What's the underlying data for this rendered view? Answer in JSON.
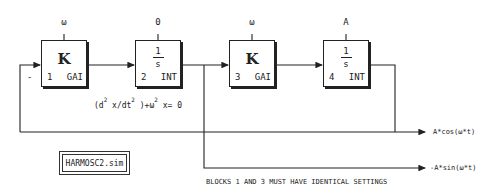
{
  "diagram": {
    "blocks": [
      {
        "id": 1,
        "symbol": "K",
        "type": "GAI",
        "param": "ω"
      },
      {
        "id": 2,
        "symbol_num": "1",
        "symbol_den": "s",
        "type": "INT",
        "param": "0"
      },
      {
        "id": 3,
        "symbol": "K",
        "type": "GAI",
        "param": "ω"
      },
      {
        "id": 4,
        "symbol_num": "1",
        "symbol_den": "s",
        "type": "INT",
        "param": "A"
      }
    ],
    "feedback_sign": "-",
    "equation": {
      "part1": "(d",
      "sup1": "2",
      "part2": " x/dt",
      "sup2": "2",
      "part3": " )+ω",
      "sup3": "2",
      "part4": " x= 0"
    },
    "outputs": {
      "cos": "A*cos(ω*t)",
      "sin": "-A*sin(ω*t)"
    },
    "file_label": "HARMOSC2.sim",
    "note": "BLOCKS 1 AND 3 MUST HAVE IDENTICAL SETTINGS",
    "colors": {
      "line": "#222222",
      "background": "#ffffff"
    }
  }
}
